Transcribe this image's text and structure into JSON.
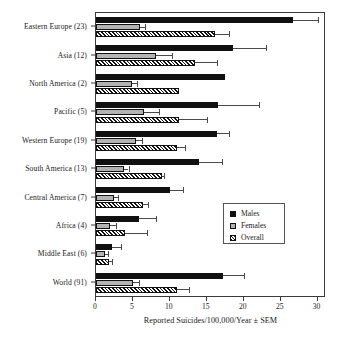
{
  "chart_data": {
    "type": "bar",
    "orientation": "horizontal",
    "title": "",
    "xlabel": "Reported Suicides/100,000/Year ± SEM",
    "ylabel": "",
    "xlim": [
      0,
      31
    ],
    "xticks": [
      0,
      5,
      10,
      15,
      20,
      25,
      30
    ],
    "xticklabels": [
      "0",
      "5",
      "10",
      "15",
      "20",
      "25",
      "30"
    ],
    "grid": false,
    "legend_position": "center-right",
    "categories": [
      "Eastern Europe (23)",
      "Asia (12)",
      "North America (2)",
      "Pacific (5)",
      "Western Europe (19)",
      "South America (13)",
      "Central America (7)",
      "Africa (4)",
      "Middle East (6)",
      "World (91)"
    ],
    "series": [
      {
        "name": "Males",
        "color": "#101010",
        "pattern": "solid-black",
        "values": [
          26.7,
          18.6,
          17.5,
          16.5,
          16.4,
          13.9,
          10.0,
          5.8,
          2.2,
          17.2
        ],
        "errors": [
          3.4,
          4.4,
          0.0,
          5.5,
          1.6,
          3.2,
          1.8,
          2.3,
          1.2,
          2.8
        ]
      },
      {
        "name": "Females",
        "color": "#b3b3b3",
        "pattern": "solid-gray",
        "values": [
          6.0,
          8.1,
          4.9,
          6.5,
          5.4,
          3.8,
          2.5,
          1.9,
          1.2,
          5.0
        ],
        "errors": [
          0.7,
          2.2,
          0.6,
          2.0,
          0.8,
          0.6,
          0.5,
          0.8,
          0.4,
          0.8
        ]
      },
      {
        "name": "Overall",
        "color": "#f2f2f2",
        "pattern": "diagonal-hatch",
        "values": [
          16.1,
          13.4,
          11.3,
          11.3,
          10.9,
          8.9,
          6.4,
          3.9,
          1.7,
          11.0
        ],
        "errors": [
          1.9,
          3.0,
          0.0,
          3.7,
          1.2,
          0.3,
          0.6,
          3.0,
          0.5,
          1.6
        ]
      }
    ],
    "legend_entries": [
      "Males",
      "Females",
      "Overall"
    ]
  },
  "axis": {
    "x_title": "Reported Suicides/100,000/Year ± SEM"
  },
  "legend": {
    "items": [
      {
        "label": "Males"
      },
      {
        "label": "Females"
      },
      {
        "label": "Overall"
      }
    ]
  }
}
